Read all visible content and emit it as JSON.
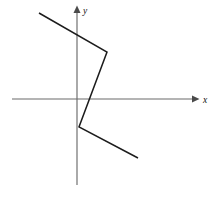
{
  "figure": {
    "background_color": "#ffffff",
    "width": 220,
    "height": 197
  },
  "axes": {
    "x_axis": {
      "label": "x",
      "label_position": {
        "x": 203,
        "y": 103
      },
      "line": {
        "x1": 12,
        "y1": 99,
        "x2": 193,
        "y2": 99
      },
      "arrow_tip": {
        "x": 199,
        "y": 99
      },
      "color": "#6b6b6b"
    },
    "y_axis": {
      "label": "y",
      "label_position": {
        "x": 83,
        "y": 14
      },
      "line": {
        "x1": 77,
        "y1": 12,
        "x2": 77,
        "y2": 185
      },
      "arrow_tip": {
        "x": 77,
        "y": 6
      },
      "color": "#6b6b6b"
    },
    "origin": {
      "x": 77,
      "y": 99
    }
  },
  "chart_data": {
    "type": "line",
    "title": "",
    "xlabel": "x",
    "ylabel": "y",
    "grid": false,
    "legend": "none",
    "series": [
      {
        "name": "piecewise-linear-curve",
        "color": "#1c1c1c",
        "points_pixels": [
          {
            "x": 39,
            "y": 13
          },
          {
            "x": 107,
            "y": 52
          },
          {
            "x": 79,
            "y": 127
          },
          {
            "x": 138,
            "y": 158
          }
        ],
        "points_axis": [
          {
            "x": -38,
            "y": 86
          },
          {
            "x": 30,
            "y": 47
          },
          {
            "x": 2,
            "y": -28
          },
          {
            "x": 61,
            "y": -59
          }
        ]
      }
    ],
    "annotations": []
  }
}
